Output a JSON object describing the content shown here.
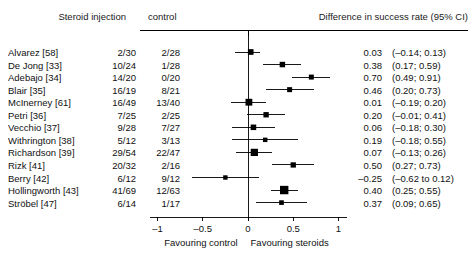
{
  "header": {
    "treatment_label": "Steroid injection",
    "control_label": "control",
    "difference_label": "Difference in success rate (95% CI)"
  },
  "axis": {
    "ticks": [
      {
        "value": -1,
        "label": "–1"
      },
      {
        "value": -0.5,
        "label": "–0.5"
      },
      {
        "value": 0,
        "label": "0"
      },
      {
        "value": 0.5,
        "label": "0.5"
      },
      {
        "value": 1,
        "label": "1"
      }
    ],
    "favouring_control": "Favouring control",
    "favouring_steroids": "Favouring steroids",
    "xlim": [
      -1.12,
      1.12
    ],
    "zero_line": 0
  },
  "colors": {
    "marker": "#000000",
    "line": "#000000",
    "text": "#111111",
    "background": "#ffffff"
  },
  "chart_data": {
    "type": "scatter",
    "title": "Difference in success rate (95% CI)",
    "xlabel": "Difference in success rate",
    "ylabel": "",
    "xlim": [
      -1.12,
      1.12
    ],
    "grid": false,
    "legend": "none",
    "categories": [
      "Alvarez [58]",
      "De Jong [33]",
      "Adebajo [34]",
      "Blair [35]",
      "McInerney [61]",
      "Petri [36]",
      "Vecchio [37]",
      "Withrington [38]",
      "Richardson [39]",
      "Rizk [41]",
      "Berry [42]",
      "Hollingworth [43]",
      "Ströbel [47]"
    ],
    "rows": [
      {
        "study": "Alvarez [58]",
        "treatment": "2/30",
        "control": "2/28",
        "estimate": 0.03,
        "ci_low": -0.14,
        "ci_high": 0.13,
        "estimate_label": "0.03",
        "ci_label": "(–0.14; 0.13)",
        "weight": 58
      },
      {
        "study": "De Jong [33]",
        "treatment": "10/24",
        "control": "1/28",
        "estimate": 0.38,
        "ci_low": 0.17,
        "ci_high": 0.59,
        "estimate_label": "0.38",
        "ci_label": "(0.17; 0.59)",
        "weight": 52
      },
      {
        "study": "Adebajo [34]",
        "treatment": "14/20",
        "control": "0/20",
        "estimate": 0.7,
        "ci_low": 0.49,
        "ci_high": 0.91,
        "estimate_label": "0.70",
        "ci_label": "(0.49; 0.91)",
        "weight": 40
      },
      {
        "study": "Blair [35]",
        "treatment": "16/19",
        "control": "8/21",
        "estimate": 0.46,
        "ci_low": 0.2,
        "ci_high": 0.73,
        "estimate_label": "0.46",
        "ci_label": "(0.20; 0.73)",
        "weight": 40
      },
      {
        "study": "McInerney [61]",
        "treatment": "16/49",
        "control": "13/40",
        "estimate": 0.01,
        "ci_low": -0.19,
        "ci_high": 0.2,
        "estimate_label": "0.01",
        "ci_label": "(–0.19; 0.20)",
        "weight": 89
      },
      {
        "study": "Petri [36]",
        "treatment": "7/25",
        "control": "2/25",
        "estimate": 0.2,
        "ci_low": -0.01,
        "ci_high": 0.41,
        "estimate_label": "0.20",
        "ci_label": "(–0.01; 0.41)",
        "weight": 50
      },
      {
        "study": "Vecchio [37]",
        "treatment": "9/28",
        "control": "7/27",
        "estimate": 0.06,
        "ci_low": -0.18,
        "ci_high": 0.3,
        "estimate_label": "0.06",
        "ci_label": "(–0.18; 0.30)",
        "weight": 55
      },
      {
        "study": "Withrington [38]",
        "treatment": "5/12",
        "control": "3/13",
        "estimate": 0.19,
        "ci_low": -0.18,
        "ci_high": 0.55,
        "estimate_label": "0.19",
        "ci_label": "(–0.18; 0.55)",
        "weight": 25
      },
      {
        "study": "Richardson [39]",
        "treatment": "29/54",
        "control": "22/47",
        "estimate": 0.07,
        "ci_low": -0.13,
        "ci_high": 0.26,
        "estimate_label": "0.07",
        "ci_label": "(–0.13; 0.26)",
        "weight": 101
      },
      {
        "study": "Rizk [41]",
        "treatment": "20/32",
        "control": "2/16",
        "estimate": 0.5,
        "ci_low": 0.27,
        "ci_high": 0.73,
        "estimate_label": "0.50",
        "ci_label": "(0.27; 0.73)",
        "weight": 48
      },
      {
        "study": "Berry [42]",
        "treatment": "6/12",
        "control": "9/12",
        "estimate": -0.25,
        "ci_low": -0.62,
        "ci_high": 0.12,
        "estimate_label": "–0.25",
        "ci_label": "(–0.62 to 0.12)",
        "weight": 24
      },
      {
        "study": "Hollingworth [43]",
        "treatment": "41/69",
        "control": "12/63",
        "estimate": 0.4,
        "ci_low": 0.25,
        "ci_high": 0.55,
        "estimate_label": "0.40",
        "ci_label": "(0.25; 0.55)",
        "weight": 132
      },
      {
        "study": "Ströbel [47]",
        "treatment": "6/14",
        "control": "1/17",
        "estimate": 0.37,
        "ci_low": 0.09,
        "ci_high": 0.65,
        "estimate_label": "0.37",
        "ci_label": "(0.09; 0.65)",
        "weight": 31
      }
    ]
  }
}
